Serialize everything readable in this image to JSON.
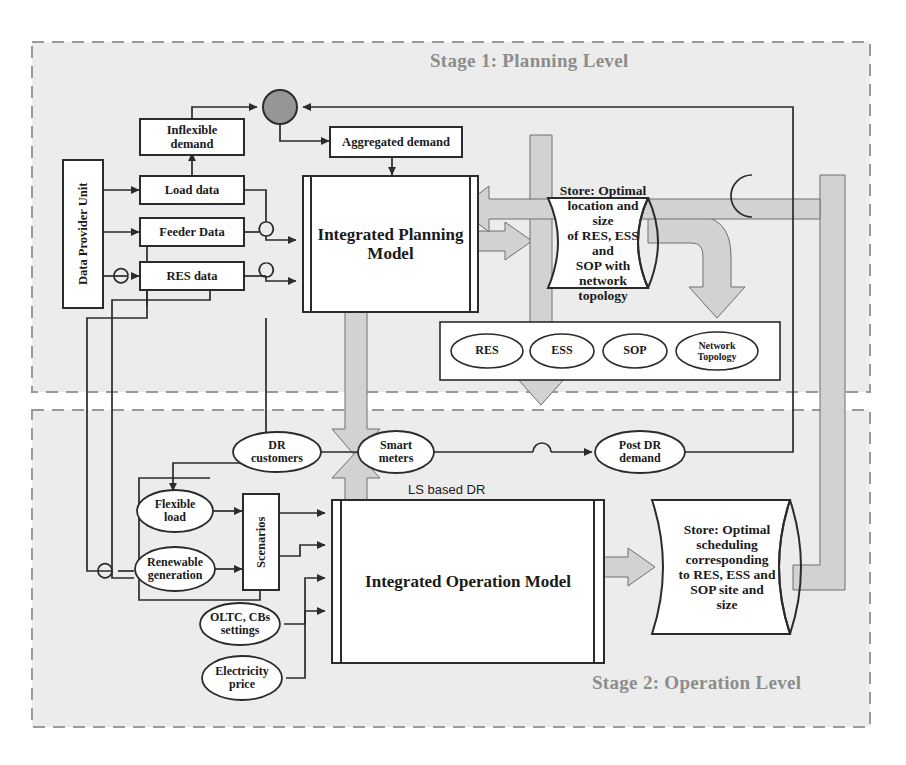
{
  "figure": {
    "background_color": "#ffffff",
    "stage_fill_color": "#ececec",
    "pipe_color": "#cfcfcf",
    "stage_label_color": "#8c8c8c",
    "line_color": "#2b2b2b"
  },
  "stages": [
    {
      "id": "stage1",
      "label": "Stage 1: Planning Level"
    },
    {
      "id": "stage2",
      "label": "Stage 2: Operation Level"
    }
  ],
  "stage1": {
    "nodes": {
      "data_provider_unit": "Data Provider Unit",
      "inflexible_demand": "Inflexible\ndemand",
      "aggregated_demand": "Aggregated demand",
      "load_data": "Load data",
      "feeder_data": "Feeder Data",
      "res_data": "RES data",
      "planning_model": "Integrated Planning\nModel",
      "sum_junction": "sum-node",
      "planning_store": "Store: Optimal\nlocation and size\nof RES, ESS and\nSOP with\nnetwork topology"
    },
    "asset_group": {
      "items": [
        "RES",
        "ESS",
        "SOP",
        "Network\nTopology"
      ]
    }
  },
  "stage2": {
    "nodes": {
      "dr_customers": "DR\ncustomers",
      "smart_meters": "Smart\nmeters",
      "post_dr_demand": "Post DR\ndemand",
      "flexible_load": "Flexible\nload",
      "renewable_generation": "Renewable\ngeneration",
      "scenarios": "Scenarios",
      "oltc_cbs_settings": "OLTC, CBs\nsettings",
      "electricity_price": "Electricity\nprice",
      "operation_model": "Integrated Operation Model",
      "operation_store": "Store: Optimal\nscheduling\ncorresponding\nto RES, ESS and\nSOP site and\nsize"
    },
    "edge_labels": {
      "ls_based_dr": "LS based DR"
    }
  }
}
